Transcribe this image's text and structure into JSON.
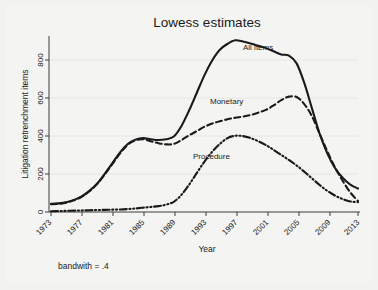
{
  "figure": {
    "background_color": "#f2f2f0",
    "plot_background_color": "#f4f4f2",
    "ink_color": "#1a1a1a",
    "footnote": "bandwith = .4"
  },
  "chart_data": {
    "type": "line",
    "title": "Lowess estimates",
    "xlabel": "Year",
    "ylabel": "Litigation retrenchment items",
    "xlim": [
      1973,
      2013
    ],
    "ylim": [
      0,
      900
    ],
    "xticks": [
      1973,
      1977,
      1981,
      1985,
      1989,
      1993,
      1997,
      2001,
      2005,
      2009,
      2013
    ],
    "yticks": [
      0,
      200,
      400,
      600,
      800
    ],
    "xtick_labels": [
      "1973",
      "1977",
      "1981",
      "1985",
      "1989",
      "1993",
      "1997",
      "2001",
      "2005",
      "2009",
      "2013"
    ],
    "ytick_labels": [
      "0",
      "200",
      "400",
      "600",
      "800"
    ],
    "xtick_rotation_deg": 45,
    "grid": "horizontal",
    "legend": "inline-labels",
    "x": [
      1973,
      1974,
      1975,
      1976,
      1977,
      1978,
      1979,
      1980,
      1981,
      1982,
      1983,
      1984,
      1985,
      1986,
      1987,
      1988,
      1989,
      1990,
      1991,
      1992,
      1993,
      1994,
      1995,
      1996,
      1997,
      1998,
      1999,
      2000,
      2001,
      2002,
      2003,
      2004,
      2005,
      2006,
      2007,
      2008,
      2009,
      2010,
      2011,
      2012,
      2013
    ],
    "series": [
      {
        "name": "All items",
        "label": "All items",
        "linestyle": "solid",
        "color": "#1a1a1a",
        "values": [
          42,
          44,
          50,
          62,
          80,
          108,
          145,
          195,
          250,
          305,
          348,
          370,
          378,
          372,
          368,
          372,
          386,
          440,
          520,
          610,
          700,
          775,
          830,
          860,
          878,
          872,
          862,
          850,
          838,
          822,
          805,
          800,
          760,
          660,
          530,
          400,
          300,
          225,
          175,
          140,
          120
        ]
      },
      {
        "name": "Monetary",
        "label": "Monetary",
        "linestyle": "dashed",
        "color": "#1a1a1a",
        "values": [
          40,
          42,
          48,
          60,
          78,
          106,
          143,
          192,
          246,
          300,
          344,
          366,
          372,
          362,
          352,
          346,
          348,
          368,
          392,
          414,
          436,
          452,
          464,
          474,
          482,
          488,
          496,
          508,
          522,
          545,
          572,
          590,
          588,
          552,
          490,
          400,
          310,
          228,
          160,
          100,
          56
        ]
      },
      {
        "name": "Procedure",
        "label": "Procedure",
        "linestyle": "dashdotdot",
        "color": "#1a1a1a",
        "values": [
          4,
          5,
          6,
          7,
          8,
          9,
          10,
          11,
          12,
          13,
          15,
          18,
          22,
          26,
          30,
          38,
          52,
          88,
          140,
          200,
          258,
          308,
          348,
          378,
          390,
          388,
          378,
          362,
          342,
          318,
          292,
          266,
          238,
          206,
          172,
          138,
          108,
          84,
          66,
          54,
          50
        ]
      }
    ]
  }
}
